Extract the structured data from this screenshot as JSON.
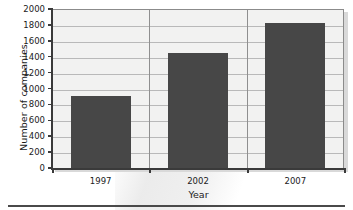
{
  "chart_data": {
    "type": "bar",
    "title": "",
    "xlabel": "Year",
    "ylabel": "Number of companies",
    "categories": [
      "1997",
      "2002",
      "2007"
    ],
    "values": [
      900,
      1450,
      1830
    ],
    "series": [
      {
        "name": "Number of companies",
        "values": [
          900,
          1450,
          1830
        ]
      }
    ],
    "ylim": [
      0,
      2000
    ],
    "ytick_labels": [
      "0",
      "200",
      "400",
      "600",
      "800",
      "1000",
      "1200",
      "1400",
      "1600",
      "1800",
      "2000"
    ],
    "ytick_values": [
      0,
      200,
      400,
      600,
      800,
      1000,
      1200,
      1400,
      1600,
      1800,
      2000
    ],
    "ytick_step": 200,
    "grid": {
      "horizontal": true,
      "vertical": true
    },
    "legend": {
      "visible": false,
      "position": "none"
    },
    "colors": {
      "bar": "#474747",
      "plot_background": "#f2f2f1",
      "horizontal_gridline": "#b9b9b9",
      "vertical_gridline": "#8f8f8f",
      "axis_line": "#3a3a3a",
      "frame_border": "#8b8b8b",
      "text": "#1b1b1b",
      "page_background": "#ffffff",
      "bottom_rule": "#4a4a4a"
    }
  }
}
